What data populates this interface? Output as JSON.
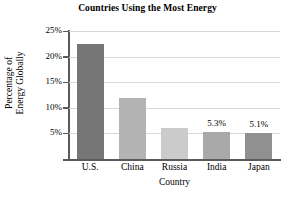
{
  "chart_data": {
    "type": "bar",
    "title": "Countries Using the Most Energy",
    "xlabel": "Country",
    "ylabel_line1": "Percentage of",
    "ylabel_line2": "Energy Globally",
    "categories": [
      "U.S.",
      "China",
      "Russia",
      "India",
      "Japan"
    ],
    "values": [
      22.5,
      12.0,
      6.1,
      5.3,
      5.1
    ],
    "point_labels": [
      "",
      "",
      "",
      "5.3%",
      "5.1%"
    ],
    "bar_colors": [
      "#767676",
      "#b3b3b3",
      "#cbcbcb",
      "#a9a9a9",
      "#909090"
    ],
    "ylim": [
      0,
      25
    ],
    "ytick_values": [
      5,
      10,
      15,
      20,
      25
    ],
    "ytick_labels": [
      "5%",
      "10%",
      "15%",
      "20%",
      "25%"
    ],
    "grid": true,
    "gridline_color": "#d8d8d8",
    "axis_color": "#5a5a5a",
    "legend": "none",
    "xlim_note": "categorical"
  }
}
